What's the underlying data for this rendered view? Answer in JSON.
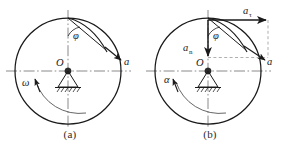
{
  "figure": {
    "type": "technical-diagram",
    "panels": [
      {
        "id": "a",
        "caption": "(a)",
        "center_label": "O",
        "labels": {
          "angle": "φ",
          "acceleration": "a",
          "angular_velocity": "ω"
        },
        "annotations": [
          {
            "name": "angle-phi",
            "text": "φ",
            "x": 73,
            "y": 35
          },
          {
            "name": "acceleration-vector-a",
            "text": "a",
            "x": 126,
            "y": 62
          },
          {
            "name": "angular-velocity-omega",
            "text": "ω",
            "x": 28,
            "y": 83
          },
          {
            "name": "center-point-O",
            "text": "O",
            "x": 61,
            "y": 63
          }
        ]
      },
      {
        "id": "b",
        "caption": "(b)",
        "center_label": "O",
        "labels": {
          "angle": "φ",
          "acceleration": "a",
          "tangential_acceleration_base": "a",
          "tangential_acceleration_sub": "τ",
          "normal_acceleration_base": "a",
          "normal_acceleration_sub": "n",
          "angular_acceleration": "α"
        },
        "annotations": [
          {
            "name": "tangential-acceleration-a-tau",
            "text": "aτ",
            "x": 246,
            "y": 16
          },
          {
            "name": "normal-acceleration-a-n",
            "text": "an",
            "x": 186,
            "y": 53
          },
          {
            "name": "angle-phi",
            "text": "φ",
            "x": 213,
            "y": 35
          },
          {
            "name": "acceleration-vector-a",
            "text": "a",
            "x": 268,
            "y": 62
          },
          {
            "name": "angular-acceleration-alpha",
            "text": "α",
            "x": 168,
            "y": 80
          },
          {
            "name": "center-point-O",
            "text": "O",
            "x": 201,
            "y": 63
          }
        ]
      }
    ],
    "geometry": {
      "circle_radius": 53,
      "panel_a_center": [
        68,
        71
      ],
      "panel_b_center": [
        208,
        71
      ],
      "top_point": [
        68,
        18
      ],
      "phi_degrees": 38
    },
    "colors": {
      "stroke": "#1a1a1a",
      "axis": "#5a5a5a",
      "dashed": "#8f8f8f",
      "background": "#ffffff"
    }
  }
}
